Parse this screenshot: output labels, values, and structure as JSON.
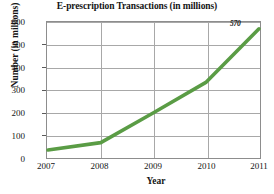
{
  "chart_data": {
    "type": "line",
    "title": "E-prescription Transactions (in millions)",
    "xlabel": "Year",
    "ylabel": "Number (in millions)",
    "x": [
      "2007",
      "2008",
      "2009",
      "2010",
      "2011"
    ],
    "values": [
      35,
      68,
      200,
      335,
      570
    ],
    "xtick_labels": [
      "2007",
      "2008",
      "2009",
      "2010",
      "2011"
    ],
    "ytick_labels": [
      "0",
      "100",
      "200",
      "300",
      "400",
      "500",
      "600"
    ],
    "ytick_values": [
      0,
      100,
      200,
      300,
      400,
      500,
      600
    ],
    "ylim": [
      0,
      600
    ],
    "grid": true,
    "legend": false,
    "series_color": "#5a9c45",
    "annotations": [
      {
        "label": "570",
        "x": "2011",
        "y": 570
      }
    ]
  }
}
